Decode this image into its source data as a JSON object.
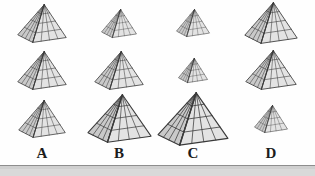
{
  "figure": {
    "title": "",
    "kind": "pyramid-size-comparison-grid",
    "background_color": "#fefefe",
    "rows": 3,
    "columns": 4,
    "stroke_color": "#3a3a3a",
    "left_face_color": "#c9c9c9",
    "right_face_color": "#e3e3e3",
    "grid_divisions": 4
  },
  "columns": [
    {
      "id": "A",
      "label": "A",
      "center_x": 42,
      "label_x": 22,
      "items": [
        {
          "name": "pyramid-a-row1",
          "width": 50,
          "height": 39,
          "row": 1
        },
        {
          "name": "pyramid-a-row2",
          "width": 50,
          "height": 39,
          "row": 2
        },
        {
          "name": "pyramid-a-row3",
          "width": 48,
          "height": 38,
          "row": 3
        }
      ]
    },
    {
      "id": "B",
      "label": "B",
      "center_x": 119,
      "label_x": 99,
      "items": [
        {
          "name": "pyramid-b-row1",
          "width": 36,
          "height": 29,
          "row": 1
        },
        {
          "name": "pyramid-b-row2",
          "width": 50,
          "height": 39,
          "row": 2
        },
        {
          "name": "pyramid-b-row3",
          "width": 65,
          "height": 49,
          "row": 3
        }
      ]
    },
    {
      "id": "C",
      "label": "C",
      "center_x": 193,
      "label_x": 173,
      "items": [
        {
          "name": "pyramid-c-row1",
          "width": 34,
          "height": 28,
          "row": 1
        },
        {
          "name": "pyramid-c-row2",
          "width": 30,
          "height": 25,
          "row": 2
        },
        {
          "name": "pyramid-c-row3",
          "width": 72,
          "height": 54,
          "row": 3
        }
      ]
    },
    {
      "id": "D",
      "label": "D",
      "center_x": 271,
      "label_x": 251,
      "items": [
        {
          "name": "pyramid-d-row1",
          "width": 54,
          "height": 42,
          "row": 1
        },
        {
          "name": "pyramid-d-row2",
          "width": 52,
          "height": 40,
          "row": 2
        },
        {
          "name": "pyramid-d-row3",
          "width": 34,
          "height": 28,
          "row": 3
        }
      ]
    }
  ],
  "rows": [
    {
      "name": "row-1",
      "top": 0,
      "height": 46
    },
    {
      "name": "row-2",
      "top": 46,
      "height": 48
    },
    {
      "name": "row-3",
      "top": 94,
      "height": 49
    }
  ],
  "footer": {
    "rule_color": "#8d8d8d",
    "band_color": "#d9d9d9"
  }
}
